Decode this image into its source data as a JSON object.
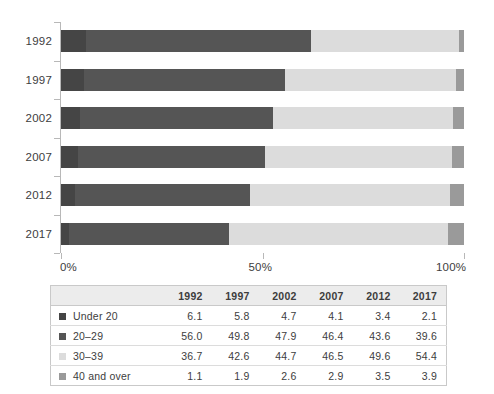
{
  "chart_data": {
    "type": "bar",
    "orientation": "horizontal",
    "stacked": true,
    "stack_mode": "percent",
    "title": "",
    "xlabel": "",
    "ylabel": "",
    "xlim": [
      0,
      100
    ],
    "grid": false,
    "legend_position": "table",
    "categories": [
      "1992",
      "1997",
      "2002",
      "2007",
      "2012",
      "2017"
    ],
    "x_tick_labels": [
      "0%",
      "50%",
      "100%"
    ],
    "x_tick_values": [
      0,
      50,
      100
    ],
    "series": [
      {
        "name": "Under 20",
        "color": "#454545",
        "values": [
          6.1,
          5.8,
          4.7,
          4.1,
          3.4,
          2.1
        ]
      },
      {
        "name": "20–29",
        "color": "#555555",
        "values": [
          56.0,
          49.8,
          47.9,
          46.4,
          43.6,
          39.6
        ]
      },
      {
        "name": "30–39",
        "color": "#dcdcdc",
        "values": [
          36.7,
          42.6,
          44.7,
          46.5,
          49.6,
          54.4
        ]
      },
      {
        "name": "40 and over",
        "color": "#9a9a9a",
        "values": [
          1.1,
          1.9,
          2.6,
          2.9,
          3.5,
          3.9
        ]
      }
    ]
  },
  "table": {
    "corner_label": "",
    "columns": [
      "1992",
      "1997",
      "2002",
      "2007",
      "2012",
      "2017"
    ],
    "rows": [
      {
        "label": "Under 20",
        "color": "#454545",
        "values": [
          "6.1",
          "5.8",
          "4.7",
          "4.1",
          "3.4",
          "2.1"
        ]
      },
      {
        "label": "20–29",
        "color": "#555555",
        "values": [
          "56.0",
          "49.8",
          "47.9",
          "46.4",
          "43.6",
          "39.6"
        ]
      },
      {
        "label": "30–39",
        "color": "#dcdcdc",
        "values": [
          "36.7",
          "42.6",
          "44.7",
          "46.5",
          "49.6",
          "54.4"
        ]
      },
      {
        "label": "40 and over",
        "color": "#9a9a9a",
        "values": [
          "1.1",
          "1.9",
          "2.6",
          "2.9",
          "3.5",
          "3.9"
        ]
      }
    ]
  }
}
